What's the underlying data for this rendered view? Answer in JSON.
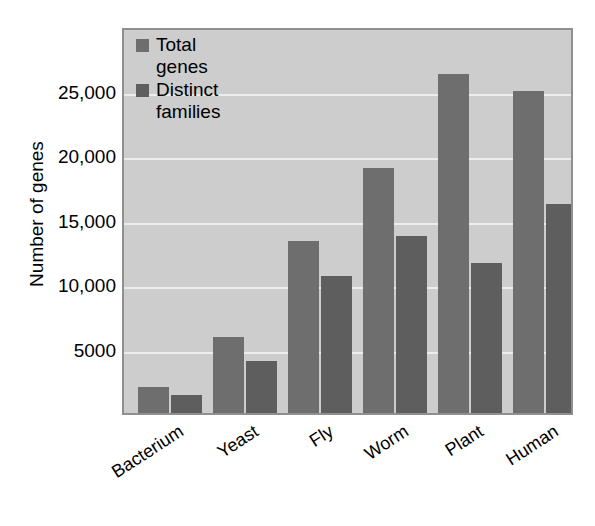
{
  "chart_data": {
    "type": "bar",
    "title": "",
    "xlabel": "",
    "ylabel": "Number of genes",
    "categories": [
      "Bacterium",
      "Yeast",
      "Fly",
      "Worm",
      "Plant",
      "Human"
    ],
    "series": [
      {
        "name": "Total genes",
        "color": "#6e6e6e",
        "values": [
          2000,
          5900,
          13300,
          19000,
          26300,
          25000
        ]
      },
      {
        "name": "Distinct families",
        "color": "#5e5e5e",
        "values": [
          1400,
          4000,
          10600,
          13700,
          11600,
          16200
        ]
      }
    ],
    "ylim": [
      0,
      30000
    ],
    "yticks": [
      5000,
      10000,
      15000,
      20000,
      25000
    ],
    "ytick_labels": [
      "5000",
      "10,000",
      "15,000",
      "20,000",
      "25,000"
    ],
    "grid": true,
    "grid_color": "#ededed",
    "legend_position": "top-left",
    "plot_background": "#cdcdcd",
    "plot_border_color": "#8f8f8f",
    "page_background": "#ffffff",
    "xtick_rotation": -33
  }
}
